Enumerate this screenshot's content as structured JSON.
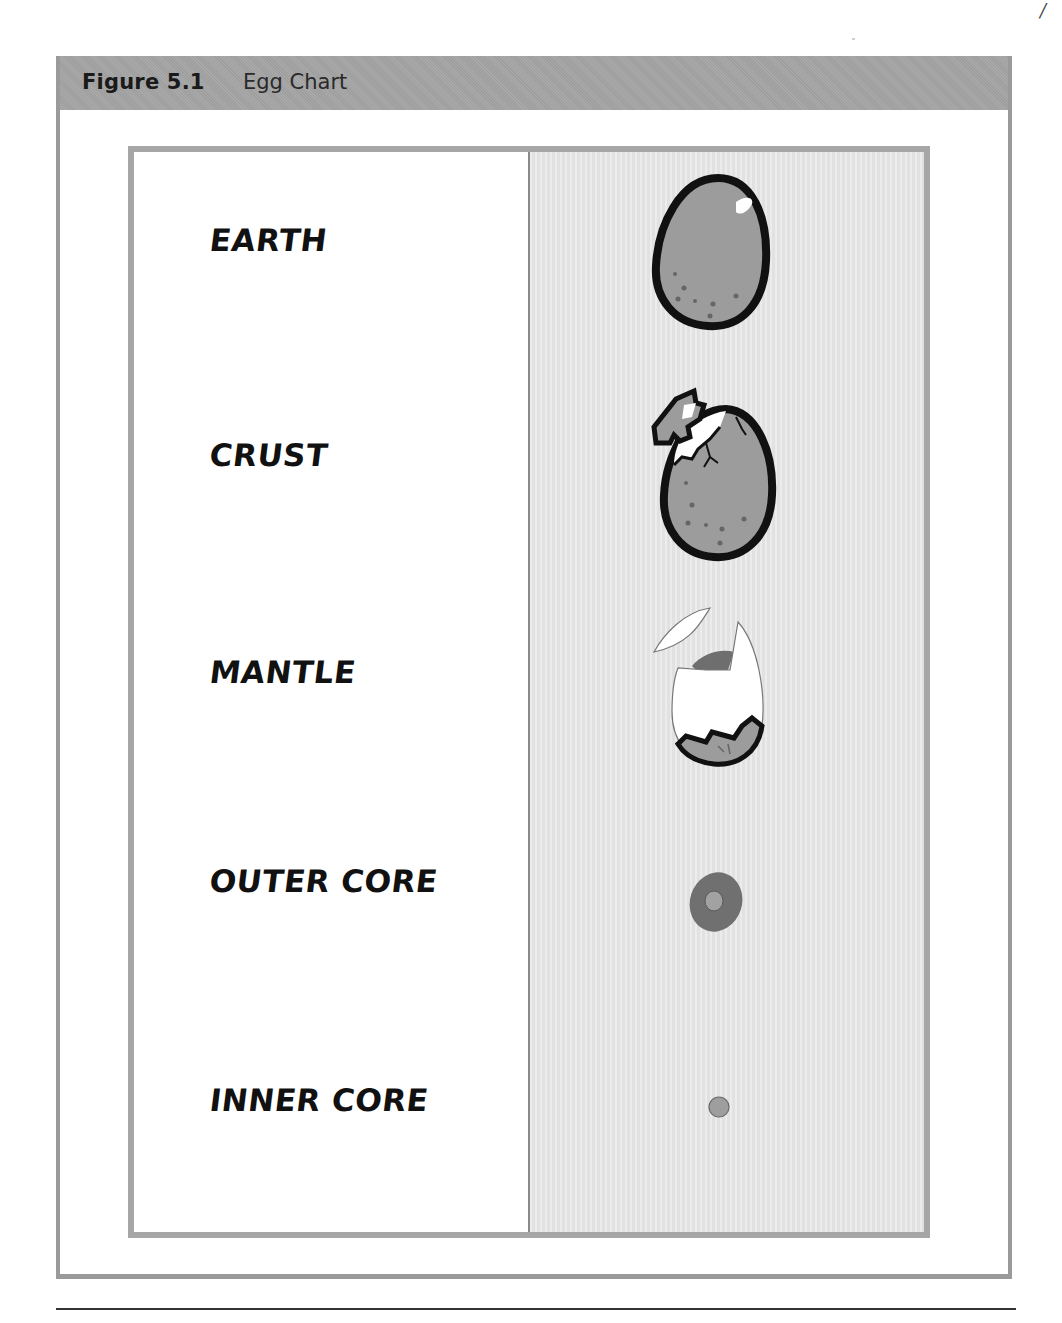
{
  "figure": {
    "number_label": "Figure 5.1",
    "title": "Egg Chart"
  },
  "page_corner_mark": "/",
  "table": {
    "rows": [
      {
        "label": "EARTH",
        "image": "whole-egg-icon"
      },
      {
        "label": "CRUST",
        "image": "cracked-egg-icon"
      },
      {
        "label": "MANTLE",
        "image": "shell-opened-egg-icon"
      },
      {
        "label": "OUTER CORE",
        "image": "yolk-ring-icon"
      },
      {
        "label": "INNER CORE",
        "image": "small-yolk-dot-icon"
      }
    ]
  },
  "colors": {
    "header_bar": "#a4a4a4",
    "frame_border": "#9a9a9a",
    "table_border": "#a6a6a6",
    "image_cell_bg": "#e6e6e6",
    "egg_fill": "#9c9c9c",
    "egg_outline": "#111111",
    "yolk_dark": "#707070",
    "yolk_light": "#9e9e9e"
  }
}
